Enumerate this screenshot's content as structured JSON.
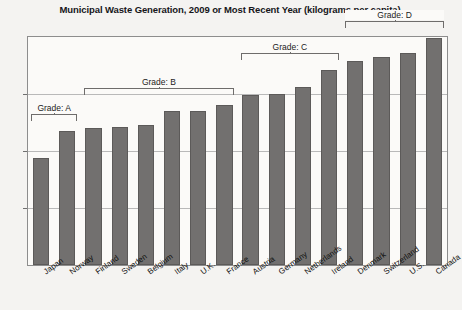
{
  "chart_data": {
    "type": "bar",
    "title": "Municipal Waste Generation, 2009 or Most Recent Year (kilograms per capita)",
    "xlabel": "",
    "ylabel": "",
    "ylim": [
      0,
      800
    ],
    "yticks": [
      0,
      200,
      400,
      600,
      800
    ],
    "ytick_labels": [
      "0",
      "200",
      "400",
      "600",
      "800"
    ],
    "grid": true,
    "legend": "none",
    "categories": [
      "Japan",
      "Norway",
      "Finland",
      "Sweden",
      "Belgium",
      "Italy",
      "U.K.",
      "France",
      "Austria",
      "Germany",
      "Netherlands",
      "Ireland",
      "Denmark",
      "Switzerland",
      "U.S.",
      "Canada"
    ],
    "values": [
      375,
      470,
      480,
      485,
      490,
      540,
      540,
      560,
      595,
      600,
      625,
      685,
      715,
      730,
      745,
      795
    ],
    "bar_color": "#72706f",
    "annotations": [
      {
        "label": "Grade: A",
        "from": "Japan",
        "to": "Norway"
      },
      {
        "label": "Grade: B",
        "from": "Finland",
        "to": "France"
      },
      {
        "label": "Grade: C",
        "from": "Austria",
        "to": "Ireland"
      },
      {
        "label": "Grade: D",
        "from": "Denmark",
        "to": "Canada"
      }
    ]
  }
}
